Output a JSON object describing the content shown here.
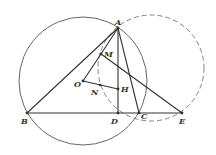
{
  "diagram": {
    "points": {
      "A": {
        "label": "A",
        "x": 118,
        "y": 28
      },
      "B": {
        "label": "B",
        "x": 27,
        "y": 113
      },
      "C": {
        "label": "C",
        "x": 139,
        "y": 113
      },
      "D": {
        "label": "D",
        "x": 118,
        "y": 113
      },
      "E": {
        "label": "E",
        "x": 182,
        "y": 113
      },
      "M": {
        "label": "M",
        "x": 101,
        "y": 54
      },
      "O": {
        "label": "O",
        "x": 83,
        "y": 81
      },
      "N": {
        "label": "N",
        "x": 100,
        "y": 85
      },
      "H": {
        "label": "H",
        "x": 118,
        "y": 89
      }
    },
    "circumcircle": {
      "cx": 83,
      "cy": 81,
      "r": 64,
      "style": "solid"
    },
    "dashed_circle": {
      "cx": 151,
      "cy": 68,
      "r": 53,
      "style": "dashed"
    },
    "segments": [
      "AB",
      "AC",
      "AD",
      "BE",
      "ME",
      "OM",
      "OH",
      "AM"
    ],
    "colors": {
      "stroke": "#333333",
      "dashed": "#777777"
    }
  }
}
